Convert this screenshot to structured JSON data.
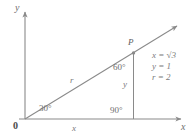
{
  "figure": {
    "type": "coordinate-diagram"
  },
  "axes": {
    "y_label": "y",
    "x_label": "x",
    "origin_label": "0"
  },
  "labels": {
    "point_p": "P",
    "ray_label": "r",
    "leg_x": "x",
    "leg_y": "y",
    "angle_origin": "30°",
    "angle_p": "60°",
    "angle_right": "90°"
  },
  "equations": [
    {
      "lhs": "x",
      "op": "=",
      "rhs": "√3",
      "radicand": "3"
    },
    {
      "lhs": "y",
      "op": "=",
      "rhs": "1"
    },
    {
      "lhs": "r",
      "op": "=",
      "rhs": "2"
    }
  ],
  "equation_lines": {
    "line1": "x = √3",
    "line2": "y = 1",
    "line3": "r = 2"
  },
  "colors": {
    "line": "#8a8a8a",
    "text": "#6e6e6e",
    "background": "#ffffff"
  },
  "geometry": {
    "origin": [
      25,
      119
    ],
    "point_p": [
      133,
      53
    ],
    "foot": [
      133,
      119
    ],
    "ray_tip": [
      182,
      23
    ],
    "x_axis_tip": [
      186,
      119
    ],
    "y_axis_tip": [
      25,
      8
    ]
  }
}
